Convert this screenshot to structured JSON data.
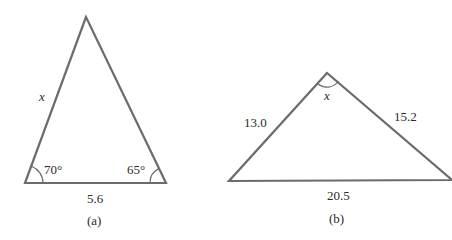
{
  "figure_a": {
    "side_label": "x",
    "angle_left": "70°",
    "angle_right": "65°",
    "base": "5.6",
    "caption": "(a)"
  },
  "figure_b": {
    "angle_label": "x",
    "left_side": "13.0",
    "right_side": "15.2",
    "base": "20.5",
    "caption": "(b)"
  },
  "colors": {
    "stroke": "#6b6b6b",
    "text": "#2a2a2a"
  }
}
